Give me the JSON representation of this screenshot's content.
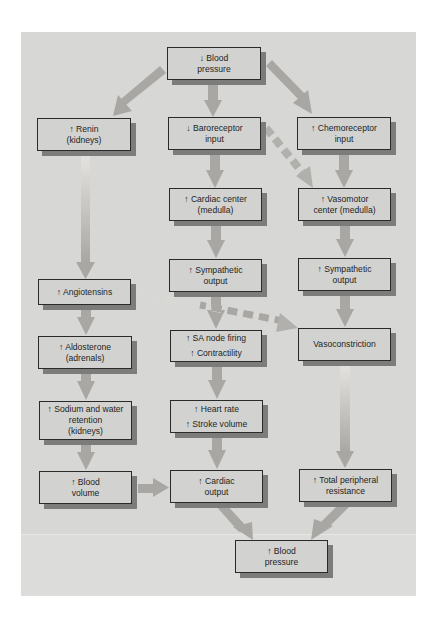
{
  "diagram": {
    "colors": {
      "panel": "#d7d8d5",
      "box_fill": "#d2d3d0",
      "box_border": "#2a2a2a",
      "box_shadow": "#7c7d7b",
      "arrow": "#a9a7a3",
      "dashed_arrow": "#b2b0ac"
    },
    "nodes": {
      "bp_down": {
        "line1": "↓ Blood",
        "line2": "pressure"
      },
      "renin": {
        "line1": "↑ Renin",
        "line2": "(kidneys)"
      },
      "baroreceptor": {
        "line1": "↓ Baroreceptor",
        "line2": "input"
      },
      "chemoreceptor": {
        "line1": "↑ Chemoreceptor",
        "line2": "input"
      },
      "cardiac_center": {
        "line1": "↑ Cardiac center",
        "line2": "(medulla)"
      },
      "vasomotor": {
        "line1": "↑ Vasomotor",
        "line2": "center (medulla)"
      },
      "sympathetic_cardiac": {
        "line1": "↑ Sympathetic",
        "line2": "output"
      },
      "sympathetic_vaso": {
        "line1": "↑ Sympathetic",
        "line2": "output"
      },
      "angiotensins": {
        "line1": "↑ Angiotensins"
      },
      "aldosterone": {
        "line1": "↑ Aldosterone",
        "line2": "(adrenals)"
      },
      "sa_node": {
        "line1": "↑ SA node firing",
        "line2": "↑ Contractility"
      },
      "vasoconstriction": {
        "line1": "Vasoconstriction"
      },
      "sodium_water": {
        "line1": "↑ Sodium and water",
        "line2": "retention",
        "line3": "(kidneys)"
      },
      "heart_rate": {
        "line1": "↑ Heart rate",
        "line2": "↑ Stroke volume"
      },
      "blood_volume": {
        "line1": "↑ Blood",
        "line2": "volume"
      },
      "cardiac_output": {
        "line1": "↑ Cardiac",
        "line2": "output"
      },
      "tpr": {
        "line1": "↑ Total peripheral",
        "line2": "resistance"
      },
      "bp_up": {
        "line1": "↑ Blood",
        "line2": "pressure"
      }
    },
    "edges": [
      {
        "from": "bp_down",
        "to": "renin",
        "style": "solid"
      },
      {
        "from": "bp_down",
        "to": "baroreceptor",
        "style": "solid"
      },
      {
        "from": "bp_down",
        "to": "chemoreceptor",
        "style": "solid"
      },
      {
        "from": "renin",
        "to": "angiotensins",
        "style": "solid"
      },
      {
        "from": "baroreceptor",
        "to": "cardiac_center",
        "style": "solid"
      },
      {
        "from": "baroreceptor",
        "to": "vasomotor",
        "style": "dashed"
      },
      {
        "from": "chemoreceptor",
        "to": "vasomotor",
        "style": "solid"
      },
      {
        "from": "cardiac_center",
        "to": "sympathetic_cardiac",
        "style": "solid"
      },
      {
        "from": "vasomotor",
        "to": "sympathetic_vaso",
        "style": "solid"
      },
      {
        "from": "angiotensins",
        "to": "aldosterone",
        "style": "solid"
      },
      {
        "from": "angiotensins",
        "to": "vasoconstriction",
        "style": "dashed"
      },
      {
        "from": "sympathetic_cardiac",
        "to": "sa_node",
        "style": "solid"
      },
      {
        "from": "sympathetic_vaso",
        "to": "vasoconstriction",
        "style": "solid"
      },
      {
        "from": "aldosterone",
        "to": "sodium_water",
        "style": "solid"
      },
      {
        "from": "sa_node",
        "to": "heart_rate",
        "style": "solid"
      },
      {
        "from": "vasoconstriction",
        "to": "tpr",
        "style": "solid"
      },
      {
        "from": "sodium_water",
        "to": "blood_volume",
        "style": "solid"
      },
      {
        "from": "heart_rate",
        "to": "cardiac_output",
        "style": "solid"
      },
      {
        "from": "blood_volume",
        "to": "cardiac_output",
        "style": "solid"
      },
      {
        "from": "cardiac_output",
        "to": "bp_up",
        "style": "solid"
      },
      {
        "from": "tpr",
        "to": "bp_up",
        "style": "solid"
      }
    ]
  }
}
